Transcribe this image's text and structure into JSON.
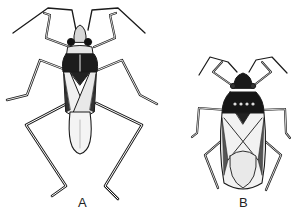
{
  "figure": {
    "panels": [
      {
        "label": "A",
        "subject": "slender long-legged bug"
      },
      {
        "label": "B",
        "subject": "stout dark-pronotum bug"
      }
    ],
    "colors": {
      "ink": "#1a1a1a",
      "paper": "#ffffff",
      "wing": "#efefef"
    }
  }
}
